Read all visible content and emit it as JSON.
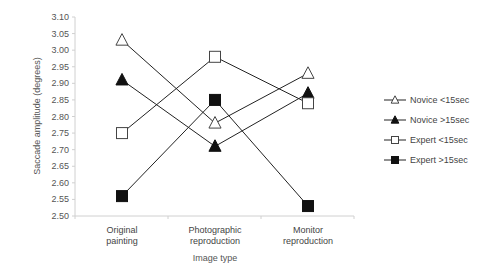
{
  "chart_data": {
    "type": "line",
    "title": "",
    "xlabel": "Image type",
    "ylabel": "Saccade amplitude (degrees)",
    "ylim": [
      2.5,
      3.1
    ],
    "yticks": [
      "3.10",
      "3.05",
      "3.00",
      "2.95",
      "2.90",
      "2.85",
      "2.80",
      "2.75",
      "2.70",
      "2.65",
      "2.60",
      "2.55",
      "2.50"
    ],
    "categories": [
      [
        "Original",
        "painting"
      ],
      [
        "Photographic",
        "reproduction"
      ],
      [
        "Monitor",
        "reproduction"
      ]
    ],
    "grid": false,
    "legend_position": "right",
    "series": [
      {
        "name": "Novice <15sec",
        "marker": "triangle-open",
        "values": [
          3.03,
          2.78,
          2.93
        ]
      },
      {
        "name": "Novice >15sec",
        "marker": "triangle-filled",
        "values": [
          2.91,
          2.71,
          2.87
        ]
      },
      {
        "name": "Expert <15sec",
        "marker": "square-open",
        "values": [
          2.75,
          2.98,
          2.84
        ]
      },
      {
        "name": "Expert >15sec",
        "marker": "square-filled",
        "values": [
          2.56,
          2.85,
          2.53
        ]
      }
    ]
  }
}
